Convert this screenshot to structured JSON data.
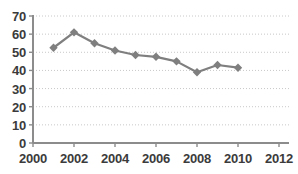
{
  "chart_data": {
    "type": "line",
    "title": "",
    "xlabel": "",
    "ylabel": "",
    "x": [
      2001,
      2002,
      2003,
      2004,
      2005,
      2006,
      2007,
      2008,
      2009,
      2010
    ],
    "values": [
      52.5,
      61,
      55,
      51,
      48.5,
      47.5,
      45,
      39,
      43,
      41.5
    ],
    "series": [
      {
        "name": "series-1",
        "values": [
          52.5,
          61,
          55,
          51,
          48.5,
          47.5,
          45,
          39,
          43,
          41.5
        ],
        "color": "#7f7f7f",
        "marker": "diamond"
      }
    ],
    "xlim": [
      2000,
      2012
    ],
    "ylim": [
      0,
      70
    ],
    "xticks": [
      2000,
      2002,
      2004,
      2006,
      2008,
      2010,
      2012
    ],
    "yticks": [
      0,
      10,
      20,
      30,
      40,
      50,
      60,
      70
    ],
    "xticklabels": [
      "2000",
      "2002",
      "2004",
      "2006",
      "2008",
      "2010",
      "2012"
    ],
    "yticklabels": [
      "0",
      "10",
      "20",
      "30",
      "40",
      "50",
      "60",
      "70"
    ],
    "grid": "horizontal-dotted",
    "legend": null,
    "colors": {
      "line": "#7f7f7f",
      "marker": "#7f7f7f",
      "axis": "#8c8c8c",
      "grid": "#c8c8c8",
      "text": "#3b3b3b",
      "background": "#ffffff"
    }
  }
}
